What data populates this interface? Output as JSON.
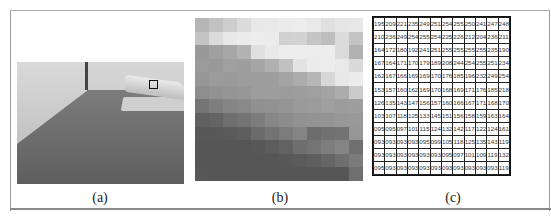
{
  "figure": {
    "panels": [
      {
        "id": "a",
        "caption": "(a)",
        "description": "Grayscale photograph of a stapler on a desk with a small boxed region"
      },
      {
        "id": "b",
        "caption": "(b)",
        "description": "Enlarged 12x12 pixel view of boxed region"
      },
      {
        "id": "c",
        "caption": "(c)",
        "description": "Grayscale pixel intensity values of boxed region"
      }
    ],
    "pixel_values": [
      [
        "195",
        "209",
        "221",
        "235",
        "249",
        "251",
        "254",
        "255",
        "250",
        "241",
        "247",
        "248"
      ],
      [
        "210",
        "236",
        "249",
        "254",
        "255",
        "254",
        "225",
        "226",
        "212",
        "204",
        "236",
        "211"
      ],
      [
        "164",
        "172",
        "180",
        "192",
        "241",
        "251",
        "255",
        "255",
        "255",
        "255",
        "235",
        "190"
      ],
      [
        "167",
        "164",
        "171",
        "170",
        "179",
        "189",
        "208",
        "244",
        "254",
        "255",
        "251",
        "234"
      ],
      [
        "162",
        "167",
        "166",
        "169",
        "169",
        "170",
        "176",
        "185",
        "196",
        "232",
        "249",
        "254"
      ],
      [
        "153",
        "157",
        "160",
        "162",
        "169",
        "170",
        "168",
        "169",
        "171",
        "176",
        "185",
        "218"
      ],
      [
        "126",
        "135",
        "143",
        "147",
        "156",
        "157",
        "160",
        "166",
        "167",
        "171",
        "168",
        "170"
      ],
      [
        "103",
        "107",
        "118",
        "125",
        "133",
        "145",
        "151",
        "156",
        "158",
        "159",
        "163",
        "164"
      ],
      [
        "095",
        "095",
        "097",
        "101",
        "115",
        "124",
        "132",
        "142",
        "117",
        "122",
        "124",
        "161"
      ],
      [
        "093",
        "093",
        "093",
        "093",
        "095",
        "099",
        "105",
        "118",
        "125",
        "135",
        "143",
        "119"
      ],
      [
        "093",
        "093",
        "093",
        "093",
        "093",
        "093",
        "095",
        "097",
        "101",
        "109",
        "119",
        "132"
      ],
      [
        "095",
        "093",
        "093",
        "093",
        "093",
        "093",
        "093",
        "093",
        "093",
        "093",
        "093",
        "119"
      ]
    ]
  }
}
